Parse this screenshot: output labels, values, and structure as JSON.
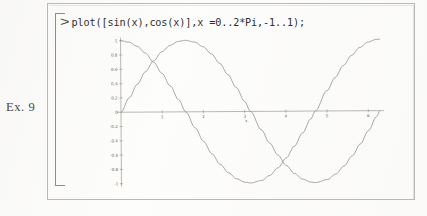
{
  "exercise": {
    "label": "Ex. 9"
  },
  "worksheet": {
    "prompt_symbol": ">",
    "command": "plot([sin(x),cos(x)],x =0..2*Pi,-1..1);"
  },
  "colors": {
    "paper": "#fdfdfc",
    "frame": "#b9b9b7",
    "bracket": "#8d8d8b",
    "text": "#2f2f2e",
    "axis": "#8a8a88",
    "curve": "#8b8b89",
    "tick_label": "#5d5d5b"
  },
  "chart_data": {
    "type": "line",
    "title": "",
    "xlabel": "x",
    "ylabel": "",
    "xlim": [
      0,
      6.283185307179586
    ],
    "ylim": [
      -1,
      1
    ],
    "grid": false,
    "legend": "none",
    "xticks": [
      1,
      2,
      3,
      4,
      5,
      6
    ],
    "xtick_labels": [
      "1",
      "2",
      "3",
      "4",
      "5",
      "6"
    ],
    "yticks": [
      1,
      0.8,
      0.6,
      0.4,
      0.2,
      0,
      -0.2,
      -0.4,
      -0.6,
      -0.8,
      -1
    ],
    "ytick_labels": [
      "1",
      "0.8",
      "0.6",
      "0.4",
      "0.2",
      "0",
      "-0.2",
      "-0.4",
      "-0.6",
      "-0.8",
      "-1"
    ],
    "x": [
      0,
      0.2,
      0.4,
      0.6,
      0.8,
      1.0,
      1.2,
      1.4,
      1.5707963,
      1.8,
      2.0,
      2.2,
      2.4,
      2.6,
      2.8,
      3.0,
      3.1415927,
      3.4,
      3.6,
      3.8,
      4.0,
      4.2,
      4.4,
      4.6,
      4.712389,
      5.0,
      5.2,
      5.4,
      5.6,
      5.8,
      6.0,
      6.2,
      6.2831853
    ],
    "series": [
      {
        "name": "sin(x)",
        "values": [
          0,
          0.1987,
          0.3894,
          0.5646,
          0.7174,
          0.8415,
          0.932,
          0.9854,
          1.0,
          0.9738,
          0.9093,
          0.8085,
          0.6755,
          0.5155,
          0.335,
          0.1411,
          0,
          -0.2555,
          -0.4425,
          -0.6119,
          -0.7568,
          -0.8716,
          -0.9516,
          -0.9937,
          -1.0,
          -0.9589,
          -0.8835,
          -0.7728,
          -0.6313,
          -0.4646,
          -0.2794,
          -0.0831,
          0
        ]
      },
      {
        "name": "cos(x)",
        "values": [
          1.0,
          0.9801,
          0.9211,
          0.8253,
          0.6967,
          0.5403,
          0.3624,
          0.17,
          0,
          -0.2272,
          -0.4161,
          -0.5885,
          -0.7374,
          -0.8569,
          -0.9422,
          -0.99,
          -1.0,
          -0.9668,
          -0.8968,
          -0.791,
          -0.6536,
          -0.4903,
          -0.3073,
          -0.1122,
          0,
          0.2837,
          0.4685,
          0.6347,
          0.7756,
          0.8855,
          0.9602,
          0.9965,
          1.0
        ]
      }
    ]
  }
}
